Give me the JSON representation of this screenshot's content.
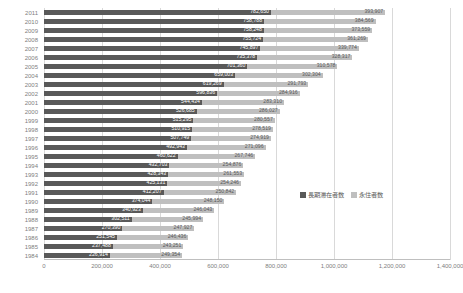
{
  "chart_data": {
    "type": "bar",
    "orientation": "horizontal",
    "stacked": true,
    "title": "",
    "xlabel": "",
    "ylabel": "",
    "xlim": [
      0,
      1400000
    ],
    "grid": true,
    "legend_position": "inside-right",
    "xticks": [
      "0",
      "200,000",
      "400,000",
      "600,000",
      "800,000",
      "1,000,000",
      "1,200,000",
      "1,400,000"
    ],
    "xtick_values": [
      0,
      200000,
      400000,
      600000,
      800000,
      1000000,
      1200000,
      1400000
    ],
    "categories": [
      "2011",
      "2010",
      "2009",
      "2008",
      "2007",
      "2006",
      "2005",
      "2004",
      "2003",
      "2002",
      "2001",
      "2000",
      "1999",
      "1998",
      "1997",
      "1996",
      "1995",
      "1994",
      "1993",
      "1992",
      "1991",
      "1990",
      "1989",
      "1988",
      "1987",
      "1986",
      "1985",
      "1984"
    ],
    "series": [
      {
        "name": "長期滞在者数",
        "color": "#595959",
        "values": [
          782650,
          758788,
          758248,
          755724,
          745897,
          735378,
          701360,
          659003,
          619269,
          596836,
          544434,
          526685,
          515295,
          510915,
          507749,
          492943,
          460622,
          432703,
          428343,
          425131,
          412207,
          374044,
          340923,
          302511,
          270390,
          251545,
          237488,
          226914
        ],
        "labels": [
          "782,650",
          "758,788",
          "758,248",
          "755,724",
          "745,897",
          "735,378",
          "701,360",
          "659,003",
          "619,269",
          "596,836",
          "544,434",
          "526,685",
          "515,295",
          "510,915",
          "507,749",
          "492,943",
          "460,622",
          "432,703",
          "428,343",
          "425,131",
          "412,207",
          "374,044",
          "340,923",
          "302,511",
          "270,390",
          "251,545",
          "237,488",
          "226,914"
        ]
      },
      {
        "name": "永住者数",
        "color": "#bfbfbf",
        "values": [
          393907,
          384569,
          373559,
          361269,
          339774,
          328317,
          310578,
          302304,
          291793,
          284916,
          283310,
          286027,
          280557,
          278519,
          274919,
          271096,
          267746,
          254876,
          261553,
          254246,
          250842,
          248150,
          246043,
          245994,
          247927,
          246436,
          243251,
          249354
        ],
        "labels": [
          "393,907",
          "384,569",
          "373,559",
          "361,269",
          "339,774",
          "328,317",
          "310,578",
          "302,304",
          "291,793",
          "284,916",
          "283,310",
          "286,027",
          "280,557",
          "278,519",
          "274,919",
          "271,096",
          "267,746",
          "254,876",
          "261,553",
          "254,246",
          "250,842",
          "248,150",
          "246,043",
          "245,994",
          "247,927",
          "246,436",
          "243,251",
          "249,354"
        ]
      }
    ]
  },
  "legend": {
    "items": [
      {
        "label": "長期滞在者数",
        "color": "#595959"
      },
      {
        "label": "永住者数",
        "color": "#bfbfbf"
      }
    ]
  },
  "colors": {
    "series_dark": "#595959",
    "series_light": "#bfbfbf",
    "gridline": "#d9d9d9",
    "axis": "#bfbfbf",
    "tick_text": "#808080"
  }
}
